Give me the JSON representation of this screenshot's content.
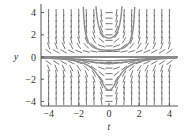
{
  "chart_data": {
    "type": "line",
    "subtype": "slope-field-with-solution-curves",
    "title": "",
    "xlabel": "t",
    "ylabel": "y",
    "xlim": [
      -4.5,
      4.5
    ],
    "ylim": [
      -4.4,
      4.4
    ],
    "x_ticks": [
      -4,
      -2,
      0,
      2,
      4
    ],
    "y_ticks": [
      -4,
      -2,
      0,
      2,
      4
    ],
    "x_tick_labels": [
      "−4",
      "−2",
      "0",
      "2",
      "4"
    ],
    "y_tick_labels": [
      "−4",
      "−2",
      "0",
      "2",
      "4"
    ],
    "grid": false,
    "legend": null,
    "slope_field": {
      "t_values": [
        -4,
        -3.5,
        -3,
        -2.5,
        -2,
        -1.5,
        -1,
        -0.5,
        0,
        0.5,
        1,
        1.5,
        2,
        2.5,
        3,
        3.5,
        4
      ],
      "y_values": [
        -4,
        -3.5,
        -3,
        -2.5,
        -2,
        -1.5,
        -1,
        -0.5,
        0,
        0.5,
        1,
        1.5,
        2,
        2.5,
        3,
        3.5,
        4
      ],
      "slope_rule": "dy/dt = t*y^2"
    },
    "series": [
      {
        "name": "equilibrium y=0",
        "kind": "constant",
        "value": 0
      },
      {
        "name": "upper solution min 0.6",
        "kind": "positive",
        "min_at_t0": 0.6,
        "asymptote_t": 1.83
      },
      {
        "name": "upper solution min 1.7",
        "kind": "positive",
        "min_at_t0": 1.7,
        "asymptote_t": 1.08
      },
      {
        "name": "lower solution min -0.33",
        "kind": "negative",
        "min_at_t0": -0.33
      },
      {
        "name": "lower solution min -0.6",
        "kind": "negative",
        "min_at_t0": -0.6
      },
      {
        "name": "lower solution min -3",
        "kind": "negative",
        "min_at_t0": -3.0
      }
    ]
  },
  "colors": {
    "axis": "#555555",
    "field": "#666666",
    "curve": "#8a8a8a",
    "text": "#333333"
  }
}
